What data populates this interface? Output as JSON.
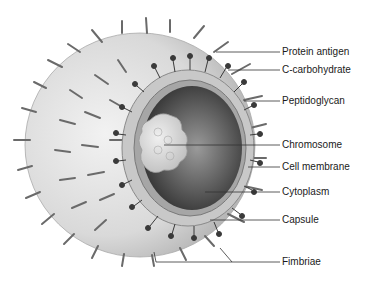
{
  "diagram": {
    "labels": [
      {
        "text": "Protein antigen",
        "x": 282,
        "y": 46
      },
      {
        "text": "C-carbohydrate",
        "x": 282,
        "y": 64
      },
      {
        "text": "Peptidoglycan",
        "x": 282,
        "y": 95
      },
      {
        "text": "Chromosome",
        "x": 282,
        "y": 139
      },
      {
        "text": "Cell membrane",
        "x": 282,
        "y": 161
      },
      {
        "text": "Cytoplasm",
        "x": 282,
        "y": 186
      },
      {
        "text": "Capsule",
        "x": 282,
        "y": 214
      },
      {
        "text": "Fimbriae",
        "x": 282,
        "y": 256
      }
    ]
  }
}
